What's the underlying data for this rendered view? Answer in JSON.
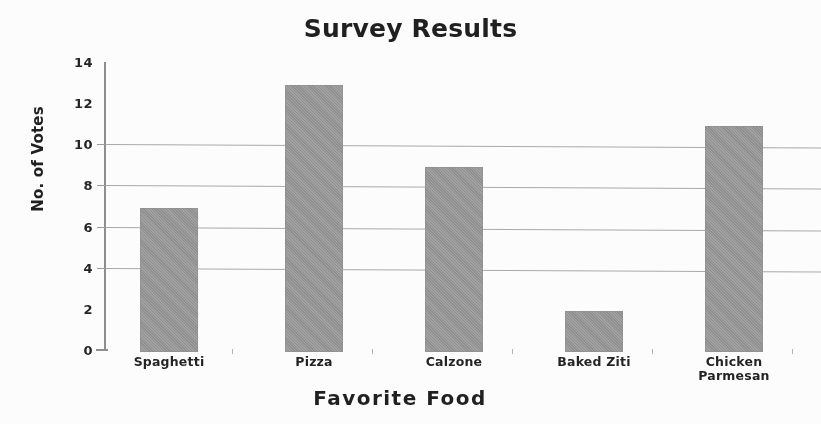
{
  "chart_data": {
    "type": "bar",
    "title": "Survey Results",
    "xlabel": "Favorite Food",
    "ylabel": "No. of Votes",
    "categories": [
      "Spaghetti",
      "Pizza",
      "Calzone",
      "Baked Ziti",
      "Chicken Parmesan"
    ],
    "values": [
      7,
      13,
      9,
      2,
      11
    ],
    "ylim": [
      0,
      14
    ],
    "ytick_labels": [
      "0",
      "2",
      "4",
      "6",
      "8",
      "10",
      "12",
      "14"
    ],
    "ytick_values": [
      0,
      2,
      4,
      6,
      8,
      10,
      12,
      14
    ],
    "gridline_values": [
      4,
      6,
      8,
      10
    ],
    "grid": true,
    "legend": "none",
    "bar_color": "#969696",
    "axis_color": "#8d8d8d",
    "grid_color": "#a9a9a9",
    "text_color": "#1c1c1c",
    "background": "#ffffff"
  },
  "labels": {
    "category_display": [
      "Spaghetti",
      "Pizza",
      "Calzone",
      "Baked Ziti",
      "Chicken\nParmesan"
    ]
  }
}
